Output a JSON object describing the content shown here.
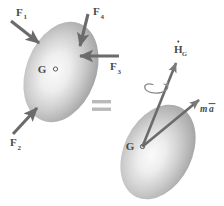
{
  "figure": {
    "background_color": "#ffffff",
    "ink_color": "#4a4a4a",
    "body_fill_dark": "#a9a9a9",
    "body_fill_light": "#f2f2f2",
    "equals_sign": "="
  },
  "left_body": {
    "center_label": "G",
    "center_marker": "circle-marker",
    "forces": [
      {
        "id": "F1",
        "base": "F",
        "subscript": "1",
        "direction": "down-right",
        "label_x": 20,
        "label_y": 16
      },
      {
        "id": "F4",
        "base": "F",
        "subscript": "4",
        "direction": "down",
        "label_x": 97,
        "label_y": 15
      },
      {
        "id": "F3",
        "base": "F",
        "subscript": "3",
        "direction": "left",
        "label_x": 115,
        "label_y": 68
      },
      {
        "id": "F2",
        "base": "F",
        "subscript": "2",
        "direction": "up-right",
        "label_x": 14,
        "label_y": 145
      }
    ]
  },
  "right_body": {
    "center_label": "G",
    "center_marker": "circle-marker",
    "vectors": [
      {
        "id": "Hdot_G",
        "base": "H",
        "accent": "dot",
        "subscript": "G",
        "direction": "up-right",
        "description": "rate of change of angular momentum about G",
        "label_x": 178,
        "label_y": 51
      },
      {
        "id": "ma",
        "base": "m",
        "accent_over": "a",
        "italic": true,
        "direction": "up-right",
        "description": "mass times acceleration of mass center",
        "label_x": 200,
        "label_y": 110
      }
    ],
    "rotation_indicator": "curved-spiral-arrow"
  }
}
